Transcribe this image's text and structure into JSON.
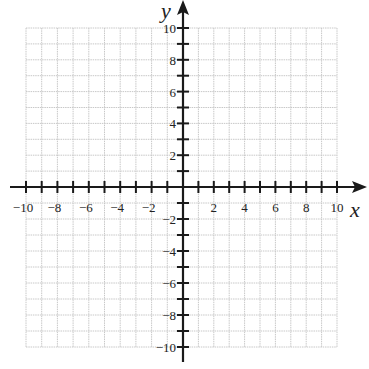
{
  "chart_data": {
    "type": "scatter",
    "title": "",
    "xlabel": "x",
    "ylabel": "y",
    "xlim": [
      -10,
      10
    ],
    "ylim": [
      -10,
      10
    ],
    "grid": true,
    "grid_step": 1,
    "tick_step": 1,
    "x_tick_labels": [
      "-10",
      "-8",
      "-6",
      "-4",
      "-2",
      "2",
      "4",
      "6",
      "8",
      "10"
    ],
    "y_tick_labels": [
      "10",
      "8",
      "6",
      "4",
      "2",
      "-2",
      "-4",
      "-6",
      "-8",
      "-10"
    ],
    "series": []
  },
  "colors": {
    "grid": "#c8c8c8",
    "axis": "#1a1a1a",
    "text": "#222222"
  }
}
